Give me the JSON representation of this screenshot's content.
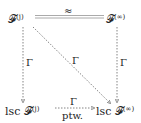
{
  "diagram": {
    "nodes": {
      "top_left": {
        "base": "𝓕",
        "sup": "(j)"
      },
      "top_right": {
        "base": "𝓕",
        "sup": "(∞)"
      },
      "bottom_left": {
        "prefix": "lsc ",
        "base": "𝓕",
        "sup": "(j)"
      },
      "bottom_right": {
        "prefix": "lsc ",
        "base": "𝓕",
        "sup": "(∞)"
      }
    },
    "edges": {
      "top": {
        "label": "≈",
        "style": "double-gray"
      },
      "left": {
        "label": "Γ",
        "style": "dashed-arrow"
      },
      "right": {
        "label": "Γ",
        "style": "dashed-arrow"
      },
      "diagonal": {
        "label": "Γ",
        "style": "dashed-arrow"
      },
      "bottom": {
        "label_above": "Γ",
        "label_below": "ptw.",
        "style": "dashed-arrow"
      }
    }
  }
}
